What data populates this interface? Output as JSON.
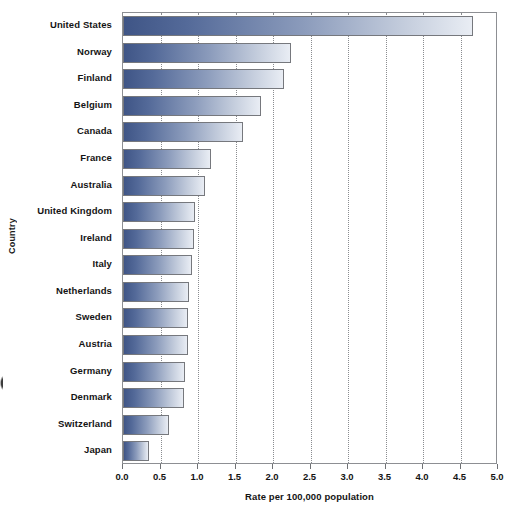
{
  "chart_data": {
    "type": "bar",
    "orientation": "horizontal",
    "title": "",
    "xlabel": "Rate per 100,000 population",
    "ylabel": "Country",
    "xlim": [
      0.0,
      5.0
    ],
    "xticks": [
      "0.0",
      "0.5",
      "1.0",
      "1.5",
      "2.0",
      "2.5",
      "3.0",
      "3.5",
      "4.0",
      "4.5",
      "5.0"
    ],
    "xtick_values": [
      0.0,
      0.5,
      1.0,
      1.5,
      2.0,
      2.5,
      3.0,
      3.5,
      4.0,
      4.5,
      5.0
    ],
    "grid": "vertical-dotted",
    "legend": "none",
    "categories": [
      "United States",
      "Norway",
      "Finland",
      "Belgium",
      "Canada",
      "France",
      "Australia",
      "United Kingdom",
      "Ireland",
      "Italy",
      "Netherlands",
      "Sweden",
      "Austria",
      "Germany",
      "Denmark",
      "Switzerland",
      "Japan"
    ],
    "values": [
      4.67,
      2.24,
      2.15,
      1.84,
      1.6,
      1.17,
      1.09,
      0.96,
      0.94,
      0.92,
      0.88,
      0.87,
      0.86,
      0.82,
      0.81,
      0.61,
      0.35
    ],
    "bar_colors": {
      "gradient_start": "#3f5586",
      "gradient_end": "#e9edf4",
      "border": "#76787d"
    },
    "axis_color": "#8d8f93",
    "gridline_color": "#8a8c90",
    "text_color": "#141414"
  }
}
